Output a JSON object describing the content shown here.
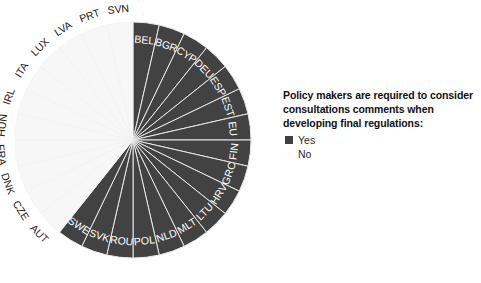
{
  "chart_data": {
    "type": "pie",
    "title": "",
    "legend_title": "Policy makers are required to consider consultations comments when developing final regulations:",
    "legend_position": "right",
    "categories": [
      "Yes",
      "No"
    ],
    "category_colors": {
      "Yes": "#424242",
      "No": "#f7f7f7"
    },
    "slice_count": 28,
    "start_angle_deg": 0,
    "direction": "clockwise",
    "equal_slices": true,
    "slices": [
      {
        "label": "BEL",
        "value": 1,
        "answer": "Yes"
      },
      {
        "label": "BGR",
        "value": 1,
        "answer": "Yes"
      },
      {
        "label": "CYP",
        "value": 1,
        "answer": "Yes"
      },
      {
        "label": "DEU",
        "value": 1,
        "answer": "Yes"
      },
      {
        "label": "ESP",
        "value": 1,
        "answer": "Yes"
      },
      {
        "label": "EST",
        "value": 1,
        "answer": "Yes"
      },
      {
        "label": "EU",
        "value": 1,
        "answer": "Yes"
      },
      {
        "label": "FIN",
        "value": 1,
        "answer": "Yes"
      },
      {
        "label": "GRC",
        "value": 1,
        "answer": "Yes"
      },
      {
        "label": "HRV",
        "value": 1,
        "answer": "Yes"
      },
      {
        "label": "LTU",
        "value": 1,
        "answer": "Yes"
      },
      {
        "label": "MLT",
        "value": 1,
        "answer": "Yes"
      },
      {
        "label": "NLD",
        "value": 1,
        "answer": "Yes"
      },
      {
        "label": "POL",
        "value": 1,
        "answer": "Yes"
      },
      {
        "label": "ROU",
        "value": 1,
        "answer": "Yes"
      },
      {
        "label": "SVK",
        "value": 1,
        "answer": "Yes"
      },
      {
        "label": "SWE",
        "value": 1,
        "answer": "Yes"
      },
      {
        "label": "AUT",
        "value": 1,
        "answer": "No"
      },
      {
        "label": "CZE",
        "value": 1,
        "answer": "No"
      },
      {
        "label": "DNK",
        "value": 1,
        "answer": "No"
      },
      {
        "label": "FRA",
        "value": 1,
        "answer": "No"
      },
      {
        "label": "HUN",
        "value": 1,
        "answer": "No"
      },
      {
        "label": "IRL",
        "value": 1,
        "answer": "No"
      },
      {
        "label": "ITA",
        "value": 1,
        "answer": "No"
      },
      {
        "label": "LUX",
        "value": 1,
        "answer": "No"
      },
      {
        "label": "LVA",
        "value": 1,
        "answer": "No"
      },
      {
        "label": "PRT",
        "value": 1,
        "answer": "No"
      },
      {
        "label": "SVN",
        "value": 1,
        "answer": "No"
      }
    ],
    "counts": {
      "Yes": 17,
      "No": 11
    },
    "geometry": {
      "cx": 133,
      "cy": 140,
      "r": 118
    }
  },
  "legend": {
    "title": "Policy makers are required to consider consultations comments when developing final regulations:",
    "items": [
      {
        "label": "Yes",
        "color": "#424242"
      },
      {
        "label": "No",
        "color": "#fdfdfd"
      }
    ]
  }
}
